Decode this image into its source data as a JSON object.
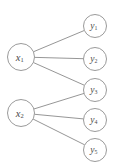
{
  "diagram": {
    "type": "bipartite-graph",
    "title": "",
    "background_color": "#ffffff",
    "node_stroke_color": "#8f8f8f",
    "node_fill_color": "#ffffff",
    "edge_color": "#8a8a8a",
    "label_color": "#4a4a4a",
    "left_nodes": [
      {
        "id": "x1",
        "base": "x",
        "subscript": "1",
        "cx": 21,
        "cy": 57,
        "r": 13.5
      },
      {
        "id": "x2",
        "base": "x",
        "subscript": "2",
        "cx": 21,
        "cy": 113,
        "r": 13.5
      }
    ],
    "right_nodes": [
      {
        "id": "y1",
        "base": "y",
        "subscript": "1",
        "cx": 95,
        "cy": 26,
        "r": 11.5
      },
      {
        "id": "y2",
        "base": "y",
        "subscript": "2",
        "cx": 95,
        "cy": 59,
        "r": 11.5
      },
      {
        "id": "y3",
        "base": "y",
        "subscript": "3",
        "cx": 95,
        "cy": 90,
        "r": 11.5
      },
      {
        "id": "y4",
        "base": "y",
        "subscript": "4",
        "cx": 95,
        "cy": 120,
        "r": 11.5
      },
      {
        "id": "y5",
        "base": "y",
        "subscript": "5",
        "cx": 95,
        "cy": 150,
        "r": 11.5
      }
    ],
    "edges": [
      {
        "from": "x1",
        "to": "y1"
      },
      {
        "from": "x1",
        "to": "y2"
      },
      {
        "from": "x1",
        "to": "y3"
      },
      {
        "from": "x2",
        "to": "y3"
      },
      {
        "from": "x2",
        "to": "y4"
      },
      {
        "from": "x2",
        "to": "y5"
      }
    ]
  }
}
